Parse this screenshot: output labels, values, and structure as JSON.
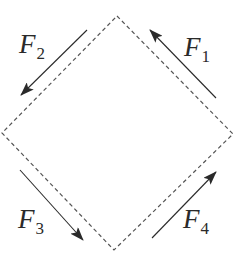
{
  "diagram": {
    "title": "",
    "background_color": "#ffffff",
    "line_color": "#333333",
    "square": {
      "style": "dashed",
      "vertices": {
        "top": [
          117,
          16
        ],
        "right": [
          233,
          134
        ],
        "bottom": [
          114,
          250
        ],
        "left": [
          2,
          133
        ]
      }
    },
    "forces": [
      {
        "id": "F1",
        "label": "F",
        "subscript": "1",
        "side": "upper-right",
        "direction": "up-left",
        "tail": [
          216,
          98
        ],
        "tip": [
          150,
          30
        ],
        "label_pos": [
          184,
          56
        ]
      },
      {
        "id": "F2",
        "label": "F",
        "subscript": "2",
        "side": "upper-left",
        "direction": "down-left",
        "tail": [
          87,
          30
        ],
        "tip": [
          21,
          95
        ],
        "label_pos": [
          19,
          53
        ]
      },
      {
        "id": "F3",
        "label": "F",
        "subscript": "3",
        "side": "lower-left",
        "direction": "down-right",
        "tail": [
          20,
          170
        ],
        "tip": [
          83,
          240
        ],
        "label_pos": [
          18,
          232
        ]
      },
      {
        "id": "F4",
        "label": "F",
        "subscript": "4",
        "side": "lower-right",
        "direction": "up-right",
        "tail": [
          152,
          238
        ],
        "tip": [
          216,
          172
        ],
        "label_pos": [
          183,
          232
        ]
      }
    ]
  }
}
